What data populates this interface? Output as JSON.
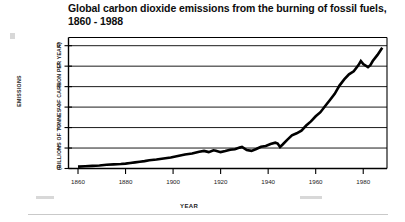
{
  "chart_data": {
    "type": "line",
    "title": "Global carbon dioxide emissions from the burning of fossil fuels, 1860 - 1988",
    "title_line1": "Global carbon dioxide emissions from the burning of fossil",
    "title_line2": "fuels, 1860 - 1988",
    "xlabel": "YEAR",
    "ylabel": "EMISSIONS",
    "ylabel_units": "(BILLIONS OF TONNES OF CARBON PER YEAR)",
    "xlim": [
      1856,
      1990
    ],
    "ylim": [
      0,
      6.4
    ],
    "xticks": [
      1860,
      1880,
      1900,
      1920,
      1940,
      1960,
      1980
    ],
    "yticks": [
      0,
      1,
      2,
      3,
      4,
      5,
      6
    ],
    "grid": "horizontal",
    "legend": "none",
    "line_color": "#000000",
    "series_name": "Global CO2 emissions from fossil fuels",
    "x": [
      1860,
      1863,
      1866,
      1869,
      1872,
      1875,
      1878,
      1880,
      1882,
      1884,
      1886,
      1888,
      1890,
      1893,
      1896,
      1899,
      1902,
      1905,
      1908,
      1911,
      1913,
      1915,
      1917,
      1918,
      1920,
      1922,
      1924,
      1926,
      1928,
      1929,
      1931,
      1933,
      1935,
      1937,
      1939,
      1941,
      1943,
      1944,
      1945,
      1946,
      1948,
      1950,
      1952,
      1954,
      1956,
      1958,
      1960,
      1962,
      1964,
      1966,
      1968,
      1970,
      1972,
      1974,
      1976,
      1978,
      1979,
      1980,
      1982,
      1983,
      1984,
      1986,
      1988
    ],
    "y": [
      0.09,
      0.11,
      0.13,
      0.15,
      0.18,
      0.2,
      0.22,
      0.24,
      0.27,
      0.3,
      0.33,
      0.36,
      0.4,
      0.44,
      0.49,
      0.54,
      0.61,
      0.68,
      0.73,
      0.82,
      0.86,
      0.8,
      0.89,
      0.87,
      0.8,
      0.85,
      0.92,
      0.94,
      1.02,
      1.05,
      0.9,
      0.86,
      0.95,
      1.06,
      1.1,
      1.2,
      1.26,
      1.22,
      1.05,
      1.16,
      1.4,
      1.62,
      1.72,
      1.85,
      2.1,
      2.3,
      2.55,
      2.75,
      3.05,
      3.35,
      3.65,
      4.05,
      4.35,
      4.6,
      4.75,
      5.05,
      5.25,
      5.1,
      4.95,
      5.05,
      5.25,
      5.55,
      5.9
    ]
  }
}
